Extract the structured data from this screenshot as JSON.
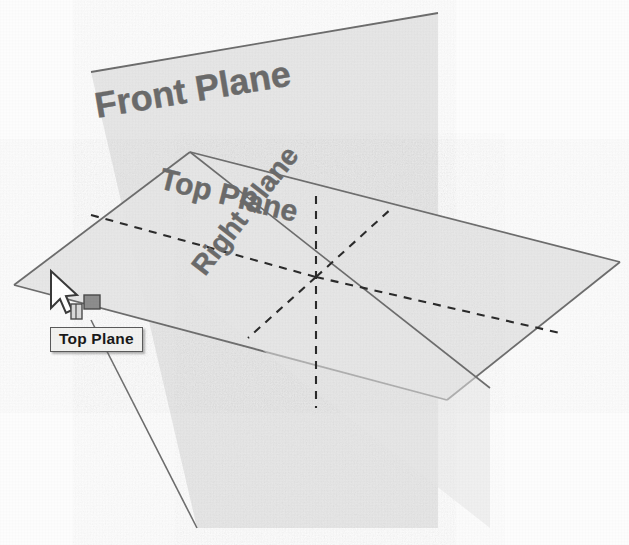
{
  "scene": {
    "title": "CAD reference planes isometric view",
    "background_color": "#fdfdfd",
    "plane_fill_color": "#e7e7e7",
    "plane_edge_color": "#6d6d6d",
    "hidden_line_color": "#2b2b2b",
    "label_color": "#6b6b6b"
  },
  "planes": [
    {
      "id": "front-plane",
      "label": "Front Plane",
      "orientation": "front",
      "label_rotation_deg": 14,
      "selected": false
    },
    {
      "id": "top-plane",
      "label": "Top Plane",
      "orientation": "top",
      "label_rotation_deg": 16,
      "selected": true
    },
    {
      "id": "right-plane",
      "label": "Right Plane",
      "orientation": "right",
      "label_rotation_deg": -52,
      "selected": false
    }
  ],
  "tooltip": {
    "text": "Top Plane",
    "visible": true,
    "background_color": "#f2f2f0",
    "border_color": "#5a5a5a",
    "text_color": "#1a1a1a"
  },
  "cursor": {
    "icon": "arrow-pointer",
    "badge_icon": "plane-badge",
    "x": 52,
    "y": 271
  },
  "icons": {
    "arrow": "arrow-pointer-icon",
    "plane_badge": "plane-badge-icon"
  }
}
